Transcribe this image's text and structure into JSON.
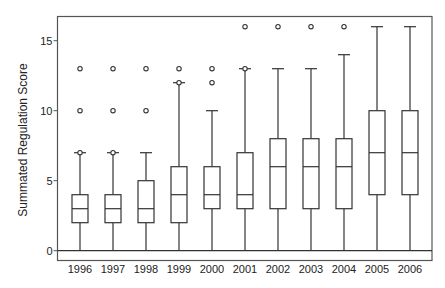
{
  "chart_data": {
    "type": "boxplot",
    "title": "",
    "xlabel": "",
    "ylabel": "Summated Regulation Score",
    "ylim": [
      -0.7,
      16.7
    ],
    "yticks": [
      0,
      5,
      10,
      15
    ],
    "grid": false,
    "legend": null,
    "reference_line_y": 0,
    "categories": [
      "1996",
      "1997",
      "1998",
      "1999",
      "2000",
      "2001",
      "2002",
      "2003",
      "2004",
      "2005",
      "2006"
    ],
    "boxes": [
      {
        "year": "1996",
        "whisker_low": 0,
        "q1": 2,
        "median": 3,
        "q3": 4,
        "whisker_high": 7,
        "outliers": [
          7,
          10,
          13
        ]
      },
      {
        "year": "1997",
        "whisker_low": 0,
        "q1": 2,
        "median": 3,
        "q3": 4,
        "whisker_high": 7,
        "outliers": [
          7,
          10,
          13
        ]
      },
      {
        "year": "1998",
        "whisker_low": 0,
        "q1": 2,
        "median": 3,
        "q3": 5,
        "whisker_high": 7,
        "outliers": [
          10,
          13
        ]
      },
      {
        "year": "1999",
        "whisker_low": 0,
        "q1": 2,
        "median": 4,
        "q3": 6,
        "whisker_high": 12,
        "outliers": [
          12,
          13
        ]
      },
      {
        "year": "2000",
        "whisker_low": 0,
        "q1": 3,
        "median": 4,
        "q3": 6,
        "whisker_high": 10,
        "outliers": [
          12,
          13
        ]
      },
      {
        "year": "2001",
        "whisker_low": 0,
        "q1": 3,
        "median": 4,
        "q3": 7,
        "whisker_high": 13,
        "outliers": [
          13,
          16
        ]
      },
      {
        "year": "2002",
        "whisker_low": 0,
        "q1": 3,
        "median": 6,
        "q3": 8,
        "whisker_high": 13,
        "outliers": [
          16
        ]
      },
      {
        "year": "2003",
        "whisker_low": 0,
        "q1": 3,
        "median": 6,
        "q3": 8,
        "whisker_high": 13,
        "outliers": [
          16
        ]
      },
      {
        "year": "2004",
        "whisker_low": 0,
        "q1": 3,
        "median": 6,
        "q3": 8,
        "whisker_high": 14,
        "outliers": [
          16
        ]
      },
      {
        "year": "2005",
        "whisker_low": 0,
        "q1": 4,
        "median": 7,
        "q3": 10,
        "whisker_high": 16,
        "outliers": []
      },
      {
        "year": "2006",
        "whisker_low": 0,
        "q1": 4,
        "median": 7,
        "q3": 10,
        "whisker_high": 16,
        "outliers": []
      }
    ]
  },
  "style": {
    "line_color": "#333333",
    "frame_color": "#555555",
    "text_color": "#222222",
    "background": "#ffffff"
  }
}
